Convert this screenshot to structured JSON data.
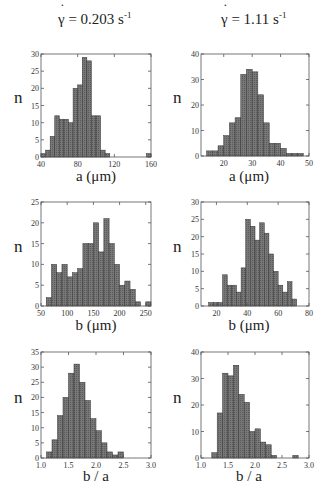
{
  "figure": {
    "columns": [
      {
        "title_symbol": "γ",
        "title_eq": " = 0.203 s",
        "title_exp": "-1"
      },
      {
        "title_symbol": "γ",
        "title_eq": " = 1.11 s",
        "title_exp": "-1"
      }
    ],
    "bar_fill": "#777777",
    "bar_edge": "#333333",
    "axis_color": "#555555"
  },
  "chart_data": [
    {
      "type": "bar",
      "panel": "top-left",
      "title": "γ̇ = 0.203 s^-1",
      "xlabel": "a  (μm)",
      "ylabel": "n",
      "xlim": [
        40,
        160
      ],
      "ylim": [
        0,
        30
      ],
      "xticks": [
        40,
        80,
        120,
        160
      ],
      "yticks": [
        0,
        5,
        10,
        15,
        20,
        25,
        30
      ],
      "bin_start": 40,
      "bin_width": 5,
      "values": [
        1,
        2,
        6,
        12,
        11,
        11,
        10,
        20,
        21,
        29,
        28,
        12,
        12,
        2,
        1,
        0,
        0,
        0,
        0,
        0,
        0,
        0,
        0,
        1
      ]
    },
    {
      "type": "bar",
      "panel": "top-right",
      "title": "γ̇ = 1.11 s^-1",
      "xlabel": "a  (μm)",
      "ylabel": "n",
      "xlim": [
        12,
        50
      ],
      "ylim": [
        0,
        40
      ],
      "xticks": [
        20,
        30,
        40,
        50
      ],
      "yticks": [
        0,
        10,
        20,
        30,
        40
      ],
      "bin_start": 14,
      "bin_width": 2,
      "values": [
        2,
        2,
        4,
        8,
        13,
        15,
        32,
        34,
        33,
        24,
        13,
        5,
        5,
        3,
        1,
        1,
        1
      ]
    },
    {
      "type": "bar",
      "panel": "middle-left",
      "xlabel": "b  (μm)",
      "ylabel": "n",
      "xlim": [
        50,
        260
      ],
      "ylim": [
        0,
        25
      ],
      "xticks": [
        50,
        100,
        150,
        200,
        250
      ],
      "yticks": [
        0,
        5,
        10,
        15,
        20,
        25
      ],
      "bin_start": 60,
      "bin_width": 10,
      "values": [
        2,
        10,
        8,
        10,
        7,
        8,
        9,
        15,
        15,
        20,
        13,
        21,
        15,
        10,
        5,
        6,
        4,
        1,
        0,
        1
      ]
    },
    {
      "type": "bar",
      "panel": "middle-right",
      "xlabel": "b  (μm)",
      "ylabel": "n",
      "xlim": [
        10,
        80
      ],
      "ylim": [
        0,
        30
      ],
      "xticks": [
        20,
        40,
        60,
        80
      ],
      "yticks": [
        0,
        5,
        10,
        15,
        20,
        25,
        30
      ],
      "bin_start": 15,
      "bin_width": 3,
      "values": [
        1,
        1,
        1,
        9,
        6,
        6,
        4,
        11,
        25,
        23,
        19,
        24,
        21,
        15,
        10,
        6,
        4,
        7,
        2
      ]
    },
    {
      "type": "bar",
      "panel": "bottom-left",
      "xlabel": "b / a",
      "ylabel": "n",
      "xlim": [
        1.0,
        3.0
      ],
      "ylim": [
        0,
        35
      ],
      "xticks": [
        1.0,
        1.5,
        2.0,
        2.5,
        3.0
      ],
      "yticks": [
        0,
        5,
        10,
        15,
        20,
        25,
        30,
        35
      ],
      "bin_start": 1.1,
      "bin_width": 0.1,
      "values": [
        2,
        6,
        14,
        20,
        28,
        31,
        25,
        19,
        13,
        9,
        5,
        2,
        1,
        2
      ]
    },
    {
      "type": "bar",
      "panel": "bottom-right",
      "xlabel": "b / a",
      "ylabel": "n",
      "xlim": [
        1.0,
        3.0
      ],
      "ylim": [
        0,
        40
      ],
      "xticks": [
        1.0,
        1.5,
        2.0,
        2.5,
        3.0
      ],
      "yticks": [
        0,
        10,
        20,
        30,
        40
      ],
      "bin_start": 1.2,
      "bin_width": 0.1,
      "values": [
        2,
        17,
        32,
        31,
        35,
        24,
        21,
        10,
        11,
        6,
        5,
        1,
        0,
        0,
        0,
        1
      ]
    }
  ]
}
